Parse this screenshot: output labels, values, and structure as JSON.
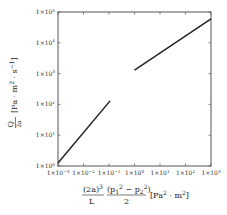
{
  "chart_data": {
    "type": "line",
    "title": "",
    "xscale": "log",
    "yscale": "log",
    "xlim": [
      0.001,
      1000
    ],
    "ylim": [
      1,
      100000
    ],
    "grid": false,
    "legend": null,
    "xlabel": "(2a)^3/L · (p1^2 − p2^2)/2 [Pa^2 · m^2]",
    "ylabel": "Q/(2a) [Pa · m^2 · s^-1]",
    "xticks": [
      0.001,
      0.01,
      0.1,
      1,
      10,
      100,
      1000
    ],
    "xtick_labels": [
      "1×10⁻³",
      "1×10⁻²",
      "1×10⁻¹",
      "1×10⁰",
      "1×10¹",
      "1×10²",
      "1×10³"
    ],
    "yticks": [
      1,
      10,
      100,
      1000,
      10000,
      100000
    ],
    "ytick_labels": [
      "1×10⁰",
      "1×10¹",
      "1×10²",
      "1×10³",
      "1×10⁴",
      "1×10⁵"
    ],
    "series": [
      {
        "name": "segment-1",
        "x": [
          0.001,
          0.11
        ],
        "y": [
          1.25,
          130
        ],
        "color": "#222222"
      },
      {
        "name": "segment-2",
        "x": [
          1.0,
          1000
        ],
        "y": [
          1300,
          60000
        ],
        "color": "#222222"
      }
    ]
  },
  "labels": {
    "x": {
      "frac1_num": "(2a)",
      "frac1_num_sup": "3",
      "frac1_den": "L",
      "frac2_num_a": "(p",
      "frac2_num_b": "1",
      "frac2_num_c": "2",
      "frac2_num_d": " − p",
      "frac2_num_e": "2",
      "frac2_num_f": "2",
      "frac2_num_g": ")",
      "frac2_den": "2",
      "unit_a": "[Pa",
      "unit_b": "2",
      "unit_c": " · m",
      "unit_d": "2",
      "unit_e": "]"
    },
    "y": {
      "num": "Q",
      "den": "2a",
      "unit_a": "[Pa · m",
      "unit_b": "2",
      "unit_c": " · s",
      "unit_d": "−1",
      "unit_e": "]"
    }
  },
  "ticks": {
    "x": [
      {
        "base": "1×10",
        "exp": "−3"
      },
      {
        "base": "1×10",
        "exp": "−2"
      },
      {
        "base": "1×10",
        "exp": "−1"
      },
      {
        "base": "1×10",
        "exp": "0"
      },
      {
        "base": "1×10",
        "exp": "1"
      },
      {
        "base": "1×10",
        "exp": "2"
      },
      {
        "base": "1×10",
        "exp": "3"
      }
    ],
    "y": [
      {
        "base": "1×10",
        "exp": "0"
      },
      {
        "base": "1×10",
        "exp": "1"
      },
      {
        "base": "1×10",
        "exp": "2"
      },
      {
        "base": "1×10",
        "exp": "3"
      },
      {
        "base": "1×10",
        "exp": "4"
      },
      {
        "base": "1×10",
        "exp": "5"
      }
    ]
  },
  "style": {
    "line_color": "#222222",
    "frame_color": "#555555"
  }
}
